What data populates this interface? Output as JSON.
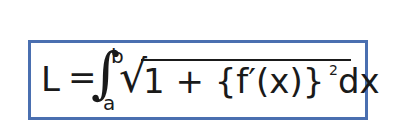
{
  "formula": {
    "description": "Arc length formula",
    "lhs": "L",
    "equals": "=",
    "integral_symbol": "∫",
    "upper_limit": "b",
    "lower_limit": "a",
    "sqrt_symbol": "√",
    "radicand": "1 + {f′(x)}",
    "exponent": "2",
    "differential": "dx"
  },
  "colors": {
    "border": "#4a6fb0",
    "text": "#1a1a1a",
    "background": "#ffffff"
  }
}
